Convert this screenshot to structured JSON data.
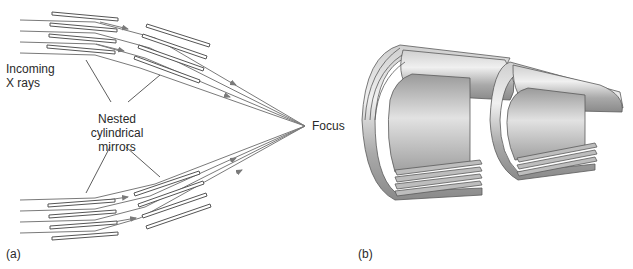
{
  "panel_a": {
    "label": "(a)",
    "incoming_label_line1": "Incoming",
    "incoming_label_line2": "X rays",
    "mirrors_label_line1": "Nested",
    "mirrors_label_line2": "cylindrical",
    "mirrors_label_line3": "mirrors",
    "focus_label": "Focus"
  },
  "panel_b": {
    "label": "(b)"
  },
  "colors": {
    "ray": "#7a7a7a",
    "mirror_stroke": "#555555",
    "metal_light": "#e6e6e6",
    "metal_mid": "#b8b8b8",
    "metal_dark": "#7c7c7c"
  }
}
